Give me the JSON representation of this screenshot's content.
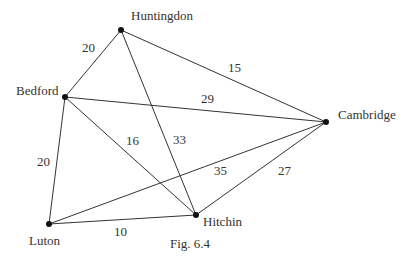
{
  "figure": {
    "caption": "Fig. 6.4",
    "caption_pos": {
      "x": 170,
      "y": 248
    }
  },
  "colors": {
    "line": "#333333",
    "node": "#111111",
    "text": "#333333",
    "background": "#ffffff"
  },
  "nodes": [
    {
      "id": "huntingdon",
      "label": "Huntingdon",
      "x": 121,
      "y": 30,
      "label_x": 131,
      "label_y": 20
    },
    {
      "id": "bedford",
      "label": "Bedford",
      "x": 65,
      "y": 97,
      "label_x": 16,
      "label_y": 95
    },
    {
      "id": "cambridge",
      "label": "Cambridge",
      "x": 326,
      "y": 122,
      "label_x": 338,
      "label_y": 119
    },
    {
      "id": "luton",
      "label": "Luton",
      "x": 49,
      "y": 224,
      "label_x": 29,
      "label_y": 245
    },
    {
      "id": "hitchin",
      "label": "Hitchin",
      "x": 196,
      "y": 215,
      "label_x": 203,
      "label_y": 226
    }
  ],
  "edges": [
    {
      "from": "huntingdon",
      "to": "bedford",
      "weight": "20",
      "label_x": 82,
      "label_y": 52
    },
    {
      "from": "huntingdon",
      "to": "cambridge",
      "weight": "15",
      "label_x": 228,
      "label_y": 72
    },
    {
      "from": "huntingdon",
      "to": "hitchin",
      "weight": "33",
      "label_x": 173,
      "label_y": 144
    },
    {
      "from": "bedford",
      "to": "cambridge",
      "weight": "29",
      "label_x": 201,
      "label_y": 103
    },
    {
      "from": "bedford",
      "to": "hitchin",
      "weight": "16",
      "label_x": 126,
      "label_y": 145
    },
    {
      "from": "bedford",
      "to": "luton",
      "weight": "20",
      "label_x": 37,
      "label_y": 166
    },
    {
      "from": "luton",
      "to": "cambridge",
      "weight": "35",
      "label_x": 214,
      "label_y": 175
    },
    {
      "from": "luton",
      "to": "hitchin",
      "weight": "10",
      "label_x": 114,
      "label_y": 236
    },
    {
      "from": "hitchin",
      "to": "cambridge",
      "weight": "27",
      "label_x": 278,
      "label_y": 175
    }
  ]
}
